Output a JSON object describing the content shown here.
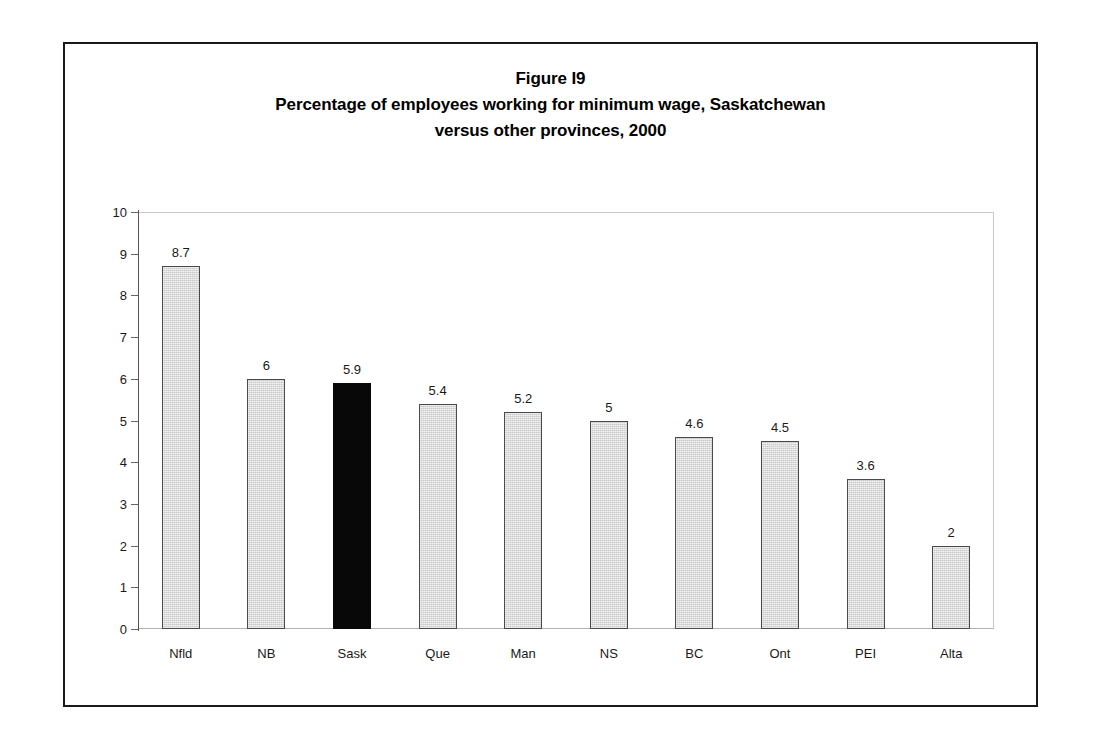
{
  "figure": {
    "title_lines": [
      "Figure I9",
      "Percentage of employees working for minimum wage, Saskatchewan",
      "versus other provinces, 2000"
    ]
  },
  "colors": {
    "bar_fill": "#c9c9c9",
    "bar_border": "#4a4a4a",
    "highlight_fill": "#080808",
    "frame": "#1a1a1a",
    "text": "#1a1a1a",
    "gridline": "#c9c9c9"
  },
  "chart_data": {
    "type": "bar",
    "xlabel": "",
    "ylabel": "",
    "ylim": [
      0,
      10
    ],
    "yticks": [
      0,
      1,
      2,
      3,
      4,
      5,
      6,
      7,
      8,
      9,
      10
    ],
    "ytick_labels": [
      "0",
      "1",
      "2",
      "3",
      "4",
      "5",
      "6",
      "7",
      "8",
      "9",
      "10"
    ],
    "grid": false,
    "legend": null,
    "highlight_category": "Sask",
    "categories": [
      "Nfld",
      "NB",
      "Sask",
      "Que",
      "Man",
      "NS",
      "BC",
      "Ont",
      "PEI",
      "Alta"
    ],
    "values": [
      8.7,
      6,
      5.9,
      5.4,
      5.2,
      5,
      4.6,
      4.5,
      3.6,
      2
    ],
    "value_labels": [
      "8.7",
      "6",
      "5.9",
      "5.4",
      "5.2",
      "5",
      "4.6",
      "4.5",
      "3.6",
      "2"
    ]
  }
}
